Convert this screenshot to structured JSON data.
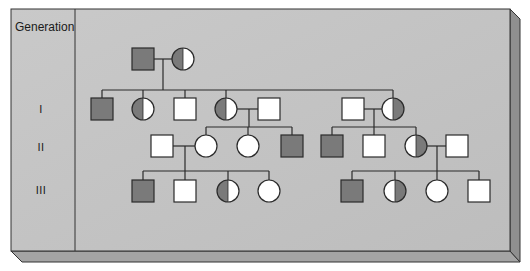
{
  "header": {
    "generation_title": "Generation"
  },
  "generations": [
    {
      "label": "I"
    },
    {
      "label": "II"
    },
    {
      "label": "III"
    }
  ],
  "colors": {
    "panel_face": "#c3c3c3",
    "panel_side": "#9a9a9a",
    "panel_bottom": "#a8a8a8",
    "affected": "#7a7a7a",
    "unaffected": "#ffffff",
    "line": "#2a2a2a"
  },
  "pedigree": {
    "legend_note": "filled = affected, half-filled circle = carrier",
    "founders": [
      {
        "id": "P1",
        "sex": "male",
        "status": "affected"
      },
      {
        "id": "P2",
        "sex": "female",
        "status": "carrier",
        "shade_side": "left"
      }
    ],
    "generation_I": [
      {
        "id": "I-1",
        "sex": "male",
        "status": "affected"
      },
      {
        "id": "I-2",
        "sex": "female",
        "status": "carrier",
        "shade_side": "left"
      },
      {
        "id": "I-3",
        "sex": "male",
        "status": "unaffected"
      },
      {
        "id": "I-4",
        "sex": "female",
        "status": "carrier",
        "shade_side": "left"
      },
      {
        "id": "I-4-spouse",
        "sex": "male",
        "status": "unaffected"
      },
      {
        "id": "I-5-spouse",
        "sex": "male",
        "status": "unaffected"
      },
      {
        "id": "I-5",
        "sex": "female",
        "status": "carrier",
        "shade_side": "right"
      }
    ],
    "generation_II": [
      {
        "id": "II-1-spouse",
        "sex": "male",
        "status": "unaffected"
      },
      {
        "id": "II-1",
        "sex": "female",
        "status": "unaffected"
      },
      {
        "id": "II-2",
        "sex": "female",
        "status": "unaffected"
      },
      {
        "id": "II-3",
        "sex": "male",
        "status": "affected"
      },
      {
        "id": "II-4",
        "sex": "male",
        "status": "affected"
      },
      {
        "id": "II-5",
        "sex": "male",
        "status": "unaffected"
      },
      {
        "id": "II-6",
        "sex": "female",
        "status": "carrier",
        "shade_side": "right"
      },
      {
        "id": "II-6-spouse",
        "sex": "male",
        "status": "unaffected"
      }
    ],
    "generation_III": [
      {
        "id": "III-1",
        "sex": "male",
        "status": "affected"
      },
      {
        "id": "III-2",
        "sex": "male",
        "status": "unaffected"
      },
      {
        "id": "III-3",
        "sex": "female",
        "status": "carrier",
        "shade_side": "left"
      },
      {
        "id": "III-4",
        "sex": "female",
        "status": "unaffected"
      },
      {
        "id": "III-5",
        "sex": "male",
        "status": "affected"
      },
      {
        "id": "III-6",
        "sex": "female",
        "status": "carrier",
        "shade_side": "right"
      },
      {
        "id": "III-7",
        "sex": "female",
        "status": "unaffected"
      },
      {
        "id": "III-8",
        "sex": "male",
        "status": "unaffected"
      }
    ]
  }
}
